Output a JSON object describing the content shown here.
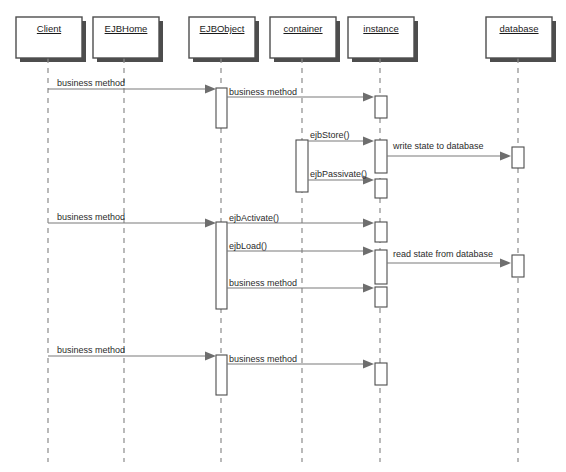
{
  "diagram": {
    "type": "uml-sequence-diagram",
    "colors": {
      "background": "#ffffff",
      "box_fill": "#ffffff",
      "box_stroke": "#4d4d4d",
      "box_shadow": "#4d4d4d",
      "lifeline": "#8c8c8c",
      "message_line": "#7a7a7a",
      "arrowhead": "#6e6e6e",
      "text": "#1f1f1f"
    },
    "participants": [
      {
        "id": "client",
        "label": "Client",
        "x": 48,
        "box_x": 16,
        "box_y": 17,
        "box_w": 66,
        "box_h": 41
      },
      {
        "id": "ejbhome",
        "label": "EJBHome",
        "x": 124,
        "box_x": 93,
        "box_y": 17,
        "box_w": 66,
        "box_h": 41
      },
      {
        "id": "ejbobject",
        "label": "EJBObject",
        "x": 221,
        "box_x": 189,
        "box_y": 17,
        "box_w": 66,
        "box_h": 41
      },
      {
        "id": "container",
        "label": "container",
        "x": 302,
        "box_x": 270,
        "box_y": 17,
        "box_w": 66,
        "box_h": 41
      },
      {
        "id": "instance",
        "label": "instance",
        "x": 380,
        "box_x": 348,
        "box_y": 17,
        "box_w": 66,
        "box_h": 41
      },
      {
        "id": "database",
        "label": "database",
        "x": 518,
        "box_x": 486,
        "box_y": 17,
        "box_w": 66,
        "box_h": 41
      }
    ],
    "lifeline_top": 58,
    "lifeline_bottom": 462,
    "activations": [
      {
        "id": "act-ejbobject-1",
        "participant": "ejbobject",
        "x": 216,
        "y": 88,
        "w": 11,
        "h": 40
      },
      {
        "id": "act-instance-1",
        "participant": "instance",
        "x": 375,
        "y": 96,
        "w": 12,
        "h": 22
      },
      {
        "id": "act-container-1",
        "participant": "container",
        "x": 296,
        "y": 140,
        "w": 12,
        "h": 52
      },
      {
        "id": "act-instance-2",
        "participant": "instance",
        "x": 375,
        "y": 140,
        "w": 12,
        "h": 33
      },
      {
        "id": "act-instance-3",
        "participant": "instance",
        "x": 375,
        "y": 179,
        "w": 12,
        "h": 19
      },
      {
        "id": "act-database-1",
        "participant": "database",
        "x": 512,
        "y": 147,
        "w": 12,
        "h": 21
      },
      {
        "id": "act-ejbobject-2",
        "participant": "ejbobject",
        "x": 216,
        "y": 222,
        "w": 11,
        "h": 87
      },
      {
        "id": "act-instance-4",
        "participant": "instance",
        "x": 375,
        "y": 222,
        "w": 12,
        "h": 20
      },
      {
        "id": "act-instance-5",
        "participant": "instance",
        "x": 375,
        "y": 250,
        "w": 12,
        "h": 34
      },
      {
        "id": "act-database-2",
        "participant": "database",
        "x": 512,
        "y": 255,
        "w": 12,
        "h": 22
      },
      {
        "id": "act-instance-6",
        "participant": "instance",
        "x": 375,
        "y": 287,
        "w": 12,
        "h": 20
      },
      {
        "id": "act-ejbobject-3",
        "participant": "ejbobject",
        "x": 216,
        "y": 355,
        "w": 11,
        "h": 40
      },
      {
        "id": "act-instance-7",
        "participant": "instance",
        "x": 375,
        "y": 363,
        "w": 12,
        "h": 22
      }
    ],
    "messages": [
      {
        "id": "m1",
        "label": "business method",
        "from_x": 48,
        "to_x": 216,
        "y": 89,
        "label_x": 57,
        "label_y": 78,
        "arrow": true
      },
      {
        "id": "m2",
        "label": "business method",
        "from_x": 227,
        "to_x": 374,
        "y": 97,
        "label_x": 229,
        "label_y": 87,
        "arrow": true
      },
      {
        "id": "m3",
        "label": "ejbStore()",
        "from_x": 308,
        "to_x": 374,
        "y": 141,
        "label_x": 310,
        "label_y": 130,
        "arrow": true
      },
      {
        "id": "m4",
        "label": "write state to database",
        "from_x": 387,
        "to_x": 511,
        "y": 156,
        "label_x": 393,
        "label_y": 141,
        "arrow": true
      },
      {
        "id": "m5",
        "label": "ejbPassivate()",
        "from_x": 308,
        "to_x": 374,
        "y": 180,
        "label_x": 310,
        "label_y": 169,
        "arrow": true
      },
      {
        "id": "m6",
        "label": "business method",
        "from_x": 48,
        "to_x": 216,
        "y": 223,
        "label_x": 57,
        "label_y": 212,
        "arrow": true
      },
      {
        "id": "m7",
        "label": "ejbActivate()",
        "from_x": 227,
        "to_x": 374,
        "y": 223,
        "label_x": 229,
        "label_y": 213,
        "arrow": true
      },
      {
        "id": "m8",
        "label": "ejbLoad()",
        "from_x": 227,
        "to_x": 374,
        "y": 251,
        "label_x": 229,
        "label_y": 241,
        "arrow": true
      },
      {
        "id": "m9",
        "label": "read state from database",
        "from_x": 387,
        "to_x": 511,
        "y": 263,
        "label_x": 393,
        "label_y": 249,
        "arrow": true
      },
      {
        "id": "m10",
        "label": "business method",
        "from_x": 227,
        "to_x": 374,
        "y": 288,
        "label_x": 229,
        "label_y": 278,
        "arrow": true
      },
      {
        "id": "m11",
        "label": "business method",
        "from_x": 48,
        "to_x": 216,
        "y": 356,
        "label_x": 57,
        "label_y": 345,
        "arrow": true
      },
      {
        "id": "m12",
        "label": "business method",
        "from_x": 227,
        "to_x": 374,
        "y": 364,
        "label_x": 229,
        "label_y": 354,
        "arrow": true
      }
    ]
  }
}
